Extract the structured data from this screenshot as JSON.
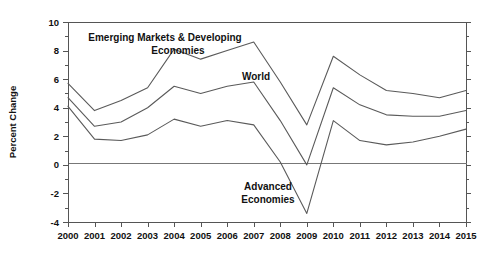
{
  "chart_data": {
    "type": "line",
    "title": "",
    "xlabel": "",
    "ylabel": "Percent Change",
    "ylim": [
      -4,
      10
    ],
    "xlim": [
      2000,
      2015
    ],
    "grid": false,
    "legend_position": "inline-annotations",
    "y_major_step": 2,
    "y_minor_step": 1,
    "zero_line": 0,
    "categories": [
      "2000",
      "2001",
      "2002",
      "2003",
      "2004",
      "2005",
      "2006",
      "2007",
      "2008",
      "2009",
      "2010",
      "2011",
      "2012",
      "2013",
      "2014",
      "2015"
    ],
    "x": [
      2000,
      2001,
      2002,
      2003,
      2004,
      2005,
      2006,
      2007,
      2008,
      2009,
      2010,
      2011,
      2012,
      2013,
      2014,
      2015
    ],
    "ytick_labels": [
      "10",
      "8",
      "6",
      "4",
      "2",
      "0",
      "-2",
      "-4"
    ],
    "ytick_values": [
      10,
      8,
      6,
      4,
      2,
      0,
      -2,
      -4
    ],
    "series": [
      {
        "name": "Emerging Markets & Developing Economies",
        "annotation": "Emerging Markets & Developing\nEconomies",
        "annotation_line1": "Emerging Markets & Developing",
        "annotation_line2": "Economies",
        "color": "#5a5a5a",
        "values": [
          5.7,
          3.8,
          4.5,
          5.4,
          8.1,
          7.4,
          8.0,
          8.6,
          5.8,
          2.8,
          7.6,
          6.3,
          5.2,
          5.0,
          4.7,
          5.2
        ]
      },
      {
        "name": "World",
        "annotation": "World",
        "color": "#5a5a5a",
        "values": [
          4.7,
          2.7,
          3.0,
          4.0,
          5.5,
          5.0,
          5.5,
          5.8,
          3.1,
          0.0,
          5.4,
          4.2,
          3.5,
          3.4,
          3.4,
          3.8
        ]
      },
      {
        "name": "Advanced Economies",
        "annotation": "Advanced\nEconomies",
        "annotation_line1": "Advanced",
        "annotation_line2": "Economies",
        "color": "#5a5a5a",
        "values": [
          4.1,
          1.8,
          1.7,
          2.1,
          3.2,
          2.7,
          3.1,
          2.8,
          0.2,
          -3.4,
          3.1,
          1.7,
          1.4,
          1.6,
          2.0,
          2.5
        ]
      }
    ],
    "annotations": [
      {
        "label_line1": "Emerging Markets & Developing",
        "label_line2": "Economies",
        "x_px": 165,
        "y_px": 38,
        "series": "Emerging Markets & Developing Economies"
      },
      {
        "label_line1": "World",
        "label_line2": "",
        "x_px": 256,
        "y_px": 79,
        "series": "World"
      },
      {
        "label_line1": "Advanced",
        "label_line2": "Economies",
        "x_px": 268,
        "y_px": 188,
        "series": "Advanced Economies"
      }
    ]
  },
  "layout": {
    "plot_left_px": 68,
    "plot_right_px": 466,
    "plot_top_px": 22,
    "plot_bottom_px": 222
  }
}
